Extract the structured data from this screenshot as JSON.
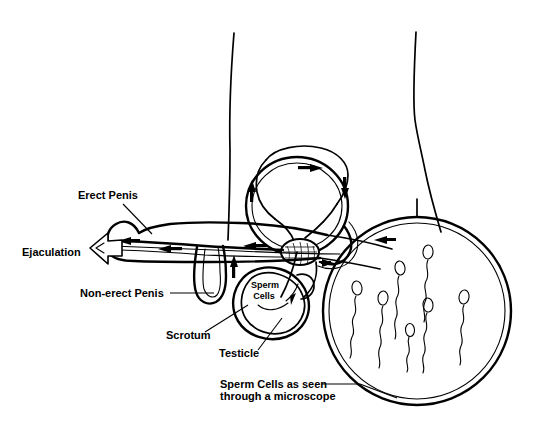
{
  "diagram": {
    "style": "black-and-white line drawing",
    "background_color": "#ffffff",
    "ink_color": "#000000",
    "labels": [
      {
        "id": "erect-penis",
        "text": "Erect Penis",
        "x": 78,
        "y": 199
      },
      {
        "id": "ejaculation",
        "text": "Ejaculation",
        "x": 22,
        "y": 256
      },
      {
        "id": "non-erect-penis",
        "text": "Non-erect Penis",
        "x": 80,
        "y": 297
      },
      {
        "id": "scrotum",
        "text": "Scrotum",
        "x": 166,
        "y": 339
      },
      {
        "id": "testicle",
        "text": "Testicle",
        "x": 219,
        "y": 357
      }
    ],
    "inline_labels": [
      {
        "id": "sperm-cells",
        "line1": "Sperm",
        "line2": "Cells",
        "x": 265,
        "y": 288
      }
    ],
    "caption": {
      "id": "microscope-caption",
      "line1": "Sperm Cells as seen",
      "line2": "through a microscope",
      "x": 220,
      "y": 388
    },
    "microscope_view": {
      "id": "microscope-circle",
      "center_x": 417,
      "center_y": 311,
      "outer_radius": 94,
      "inner_radius": 88,
      "sperm_count": 7
    },
    "flow_arrows": {
      "count": 8,
      "description": "solid black arrowheads showing direction of sperm travel"
    },
    "ejaculation_arrow": {
      "id": "ejaculation-block-arrow",
      "direction": "left",
      "style": "hollow outlined block arrow"
    }
  }
}
